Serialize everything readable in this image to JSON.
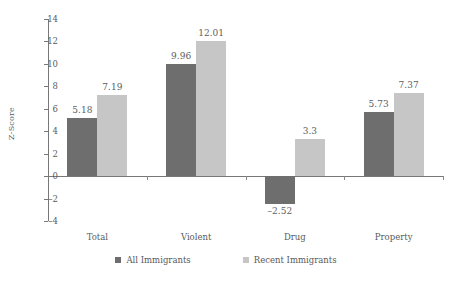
{
  "chart_data": {
    "type": "bar",
    "title": "",
    "subtitle": "",
    "xlabel": "",
    "ylabel": "Z-Score",
    "categories": [
      "Total",
      "Violent",
      "Drug",
      "Property"
    ],
    "series": [
      {
        "name": "All Immigrants",
        "color": "#6e6e6e",
        "values": [
          5.18,
          9.96,
          -2.52,
          5.73
        ],
        "labels": [
          "5.18",
          "9.96",
          "–2.52",
          "5.73"
        ]
      },
      {
        "name": "Recent Immigrants",
        "color": "#c6c6c6",
        "values": [
          7.19,
          12.01,
          3.3,
          7.37
        ],
        "labels": [
          "7.19",
          "12.01",
          "3.3",
          "7.37"
        ]
      }
    ],
    "ylim": [
      -4,
      14
    ],
    "ytick_values": [
      14,
      12,
      10,
      8,
      6,
      4,
      2,
      0,
      -2,
      -4
    ],
    "ytick_labels": [
      "14",
      "12",
      "10",
      "8",
      "6",
      "4",
      "2",
      "0",
      "–2",
      "–4"
    ],
    "grid": false,
    "legend_position": "bottom",
    "zero_line": true,
    "background": "#ffffff",
    "axis_color": "#777777",
    "text_color": "#5a5a5a"
  },
  "legend": {
    "items": [
      {
        "label": "All Immigrants",
        "swatch": "dark"
      },
      {
        "label": "Recent Immigrants",
        "swatch": "light"
      }
    ]
  }
}
